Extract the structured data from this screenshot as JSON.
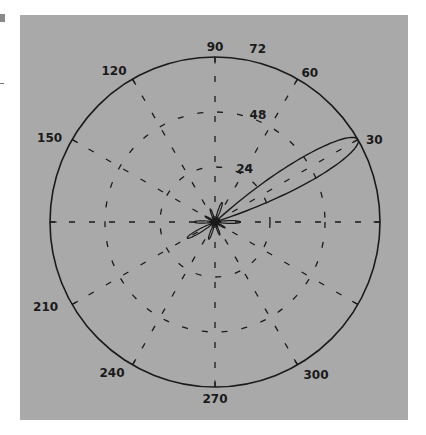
{
  "chart_data": {
    "type": "polar",
    "title": "",
    "background": "#a9a9a9",
    "line_color": "#1a1a1a",
    "rlim": [
      0,
      72
    ],
    "radial_ticks": [
      {
        "value": 24,
        "label": "24"
      },
      {
        "value": 48,
        "label": "48"
      },
      {
        "value": 72,
        "label": "72"
      }
    ],
    "angle_ticks": [
      {
        "deg": 30,
        "label": "30"
      },
      {
        "deg": 60,
        "label": "60"
      },
      {
        "deg": 90,
        "label": "90"
      },
      {
        "deg": 120,
        "label": "120"
      },
      {
        "deg": 150,
        "label": "150"
      },
      {
        "deg": 210,
        "label": "210"
      },
      {
        "deg": 240,
        "label": "240"
      },
      {
        "deg": 270,
        "label": "270"
      },
      {
        "deg": 300,
        "label": "300"
      }
    ],
    "grid": "dashed",
    "series": [
      {
        "name": "radiation pattern",
        "main_lobe": {
          "direction_deg": 30,
          "peak": 72,
          "beamwidth_deg": 12
        },
        "side_lobes": [
          {
            "direction_deg": 210,
            "peak": 14
          },
          {
            "direction_deg": 0,
            "peak": 11
          },
          {
            "direction_deg": 180,
            "peak": 9
          },
          {
            "direction_deg": 70,
            "peak": 9
          },
          {
            "direction_deg": 250,
            "peak": 8
          },
          {
            "direction_deg": 110,
            "peak": 6
          },
          {
            "direction_deg": 290,
            "peak": 6
          },
          {
            "direction_deg": 150,
            "peak": 5
          },
          {
            "direction_deg": 330,
            "peak": 5
          }
        ]
      }
    ]
  }
}
